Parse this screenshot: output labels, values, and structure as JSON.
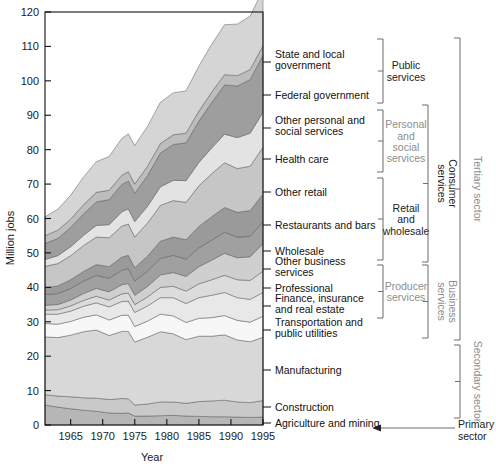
{
  "chart_data": {
    "type": "area",
    "title": "",
    "xlabel": "Year",
    "ylabel": "Million jobs",
    "xlim": [
      1961,
      1995
    ],
    "ylim": [
      0,
      120
    ],
    "ytick_labels": [
      "0",
      "10",
      "20",
      "30",
      "40",
      "50",
      "60",
      "70",
      "80",
      "90",
      "100",
      "110",
      "120"
    ],
    "ytick_values": [
      0,
      10,
      20,
      30,
      40,
      50,
      60,
      70,
      80,
      90,
      100,
      110,
      120
    ],
    "xtick_labels": [
      "1965",
      "1970",
      "1975",
      "1980",
      "1985",
      "1990",
      "1995"
    ],
    "xtick_values": [
      1965,
      1970,
      1975,
      1980,
      1985,
      1990,
      1995
    ],
    "grid": false,
    "legend": "right-side category labels with brackets",
    "stack_order": "bottom-to-top",
    "x": [
      1961,
      1963,
      1965,
      1967,
      1969,
      1971,
      1973,
      1974,
      1975,
      1977,
      1979,
      1981,
      1983,
      1985,
      1987,
      1989,
      1991,
      1993,
      1995
    ],
    "series": [
      {
        "name": "Agriculture and mining",
        "color": "#b6b6b6",
        "values": [
          5.8,
          5.2,
          4.7,
          4.3,
          4.0,
          3.5,
          3.4,
          3.5,
          2.6,
          2.6,
          2.7,
          2.8,
          2.6,
          2.5,
          2.4,
          2.4,
          2.3,
          2.2,
          2.3
        ]
      },
      {
        "name": "Construction",
        "color": "#c9c9c9",
        "values": [
          3.0,
          3.2,
          3.5,
          3.6,
          3.8,
          3.9,
          4.3,
          4.1,
          3.2,
          3.5,
          4.0,
          3.9,
          3.7,
          4.3,
          4.6,
          4.8,
          4.4,
          4.3,
          4.8
        ]
      },
      {
        "name": "Manufacturing",
        "color": "#d8d8d8",
        "values": [
          16.8,
          17.0,
          17.9,
          19.2,
          19.8,
          18.6,
          19.5,
          19.6,
          18.3,
          19.4,
          20.4,
          19.8,
          18.5,
          19.0,
          18.8,
          19.0,
          18.0,
          17.7,
          18.4
        ]
      },
      {
        "name": "Transportation and public utilities",
        "color": "#f7f7f7",
        "values": [
          3.9,
          3.9,
          4.0,
          4.2,
          4.4,
          4.5,
          4.7,
          4.7,
          4.5,
          4.7,
          5.1,
          5.2,
          5.0,
          5.2,
          5.4,
          5.6,
          5.7,
          5.7,
          6.1
        ]
      },
      {
        "name": "Finance, insurance and real estate",
        "color": "#e8e8e8",
        "values": [
          2.7,
          2.9,
          3.0,
          3.2,
          3.5,
          3.8,
          4.0,
          4.1,
          4.1,
          4.4,
          4.8,
          5.3,
          5.5,
          6.0,
          6.5,
          6.7,
          6.6,
          6.6,
          6.9
        ]
      },
      {
        "name": "Professional",
        "color": "#dcdcdc",
        "values": [
          1.2,
          1.3,
          1.5,
          1.7,
          1.9,
          2.0,
          2.2,
          2.3,
          2.3,
          2.6,
          3.0,
          3.3,
          3.6,
          4.0,
          4.5,
          5.0,
          5.2,
          5.5,
          6.2
        ]
      },
      {
        "name": "Other business services",
        "color": "#cfcfcf",
        "values": [
          1.4,
          1.5,
          1.7,
          2.0,
          2.3,
          2.4,
          2.7,
          2.8,
          2.7,
          3.1,
          3.6,
          4.0,
          4.3,
          5.0,
          5.7,
          6.4,
          6.4,
          6.9,
          8.0
        ]
      },
      {
        "name": "Wholesale",
        "color": "#a0a0a0",
        "values": [
          3.1,
          3.2,
          3.4,
          3.6,
          3.8,
          3.9,
          4.2,
          4.3,
          4.1,
          4.4,
          4.8,
          5.0,
          5.0,
          5.5,
          5.8,
          6.1,
          6.0,
          5.9,
          6.4
        ]
      },
      {
        "name": "Restaurants and bars",
        "color": "#9a9a9a",
        "values": [
          2.0,
          2.2,
          2.5,
          2.8,
          3.1,
          3.4,
          3.8,
          3.9,
          3.9,
          4.4,
          5.0,
          5.3,
          5.6,
          6.2,
          6.8,
          7.2,
          7.2,
          7.5,
          8.0
        ]
      },
      {
        "name": "Other retail",
        "color": "#c6c6c6",
        "values": [
          6.2,
          6.5,
          7.0,
          7.5,
          8.0,
          8.4,
          9.0,
          9.1,
          8.9,
          9.6,
          10.4,
          10.6,
          10.9,
          11.8,
          12.5,
          13.0,
          12.7,
          12.9,
          13.6
        ]
      },
      {
        "name": "Health care",
        "color": "#e3e3e3",
        "values": [
          2.0,
          2.3,
          2.6,
          3.0,
          3.4,
          3.8,
          4.2,
          4.4,
          4.5,
          4.9,
          5.4,
          5.9,
          6.3,
          6.8,
          7.5,
          8.3,
          9.0,
          9.6,
          10.2
        ]
      },
      {
        "name": "Other personal and social services",
        "color": "#9e9e9e",
        "values": [
          4.6,
          5.0,
          5.6,
          6.2,
          6.8,
          7.3,
          7.9,
          8.1,
          8.2,
          8.9,
          9.8,
          10.4,
          11.0,
          12.0,
          13.2,
          14.3,
          15.0,
          15.6,
          16.5
        ]
      },
      {
        "name": "Federal government",
        "color": "#bdbdbd",
        "values": [
          2.3,
          2.4,
          2.4,
          2.7,
          2.8,
          2.7,
          2.7,
          2.7,
          2.7,
          2.7,
          2.8,
          2.8,
          2.8,
          2.9,
          3.0,
          3.0,
          3.0,
          2.9,
          2.8
        ]
      },
      {
        "name": "State and local government",
        "color": "#d5d5d5",
        "values": [
          5.5,
          6.1,
          7.0,
          8.0,
          8.9,
          9.8,
          10.7,
          11.0,
          11.2,
          11.6,
          12.0,
          12.2,
          12.3,
          13.1,
          13.9,
          14.5,
          15.0,
          15.5,
          16.3
        ]
      }
    ]
  },
  "axis": {
    "y_title": "Million jobs",
    "x_title": "Year"
  },
  "category_labels": [
    {
      "text1": "State and local",
      "text2": "government",
      "y": 62
    },
    {
      "text1": "Federal government",
      "text2": "",
      "y": 99
    },
    {
      "text1": "Other personal and",
      "text2": "social services",
      "y": 128
    },
    {
      "text1": "Health care",
      "text2": "",
      "y": 163
    },
    {
      "text1": "Other retail",
      "text2": "",
      "y": 196
    },
    {
      "text1": "Restaurants and bars",
      "text2": "",
      "y": 229
    },
    {
      "text1": "Wholesale",
      "text2": "",
      "y": 255
    },
    {
      "text1": "Other business",
      "text2": "services",
      "y": 269
    },
    {
      "text1": "Professional",
      "text2": "",
      "y": 292
    },
    {
      "text1": "Finance, insurance",
      "text2": "and real estate",
      "y": 306
    },
    {
      "text1": "Transportation and",
      "text2": "public utilities",
      "y": 330
    },
    {
      "text1": "Manufacturing",
      "text2": "",
      "y": 374
    },
    {
      "text1": "Construction",
      "text2": "",
      "y": 411
    },
    {
      "text1": "Agriculture and mining",
      "text2": "",
      "y": 427
    }
  ],
  "groups": [
    {
      "name": "Public services",
      "lines": [
        "Public",
        "services"
      ],
      "top": 39,
      "bottom": 103,
      "muted": false
    },
    {
      "name": "Personal and social services",
      "lines": [
        "Personal",
        "and",
        "social",
        "services"
      ],
      "top": 110,
      "bottom": 172,
      "muted": true
    },
    {
      "name": "Retail and wholesale",
      "lines": [
        "Retail",
        "and",
        "wholesale"
      ],
      "top": 178,
      "bottom": 260,
      "muted": false
    },
    {
      "name": "Producer services",
      "lines": [
        "Producer",
        "services"
      ],
      "top": 265,
      "bottom": 318,
      "muted": true
    }
  ],
  "supergroups": [
    {
      "name": "Consumer services",
      "lines": [
        "Consumer",
        "services"
      ],
      "top": 105,
      "bottom": 262,
      "muted": false
    },
    {
      "name": "Business services",
      "lines": [
        "Business",
        "services"
      ],
      "top": 265,
      "bottom": 338,
      "muted": true
    }
  ],
  "sectors": [
    {
      "name": "Tertiary sector",
      "lines": [
        "Tertiary sector"
      ],
      "top": 38,
      "bottom": 340,
      "muted": true
    },
    {
      "name": "Secondary sector",
      "lines": [
        "Secondary sector"
      ],
      "top": 345,
      "bottom": 418,
      "muted": true
    },
    {
      "name": "Primary sector",
      "lines": [
        "Primary",
        "sector"
      ],
      "top": 420,
      "bottom": 440,
      "muted": false
    }
  ]
}
